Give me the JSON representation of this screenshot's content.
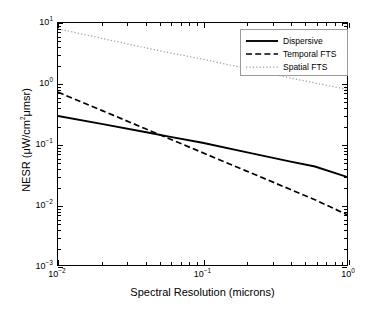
{
  "chart_data": {
    "type": "line",
    "title": "",
    "xlabel": "Spectral Resolution (microns)",
    "ylabel": "NESR (μW/cm²μmsr)",
    "xscale": "log",
    "yscale": "log",
    "xlim": [
      0.01,
      1.0
    ],
    "ylim": [
      0.001,
      10.0
    ],
    "grid": false,
    "legend_position": "top-right",
    "xticks": [
      0.01,
      0.1,
      1.0
    ],
    "xticklabels": [
      "10-2",
      "10-1",
      "100"
    ],
    "yticks": [
      0.001,
      0.01,
      0.1,
      1.0,
      10.0
    ],
    "yticklabels": [
      "10-3",
      "10-2",
      "10-1",
      "100",
      "101"
    ],
    "series": [
      {
        "name": "Dispersive",
        "style": "solid",
        "color": "#000000",
        "x": [
          0.01,
          0.02,
          0.04,
          0.06,
          0.1,
          0.2,
          0.4,
          0.6,
          1.0
        ],
        "y": [
          0.29,
          0.215,
          0.158,
          0.131,
          0.105,
          0.0735,
          0.0515,
          0.0425,
          0.0285
        ]
      },
      {
        "name": "Temporal FTS",
        "style": "dashed",
        "color": "#000000",
        "x": [
          0.01,
          0.02,
          0.04,
          0.06,
          0.1,
          0.2,
          0.4,
          0.6,
          1.0
        ],
        "y": [
          0.72,
          0.36,
          0.18,
          0.12,
          0.072,
          0.036,
          0.018,
          0.012,
          0.0068
        ]
      },
      {
        "name": "Spatial FTS",
        "style": "dotted",
        "color": "#9a9a9a",
        "x": [
          0.01,
          0.02,
          0.04,
          0.06,
          0.1,
          0.2,
          0.4,
          0.6,
          1.0
        ],
        "y": [
          8.0,
          5.6,
          3.9,
          3.2,
          2.53,
          1.77,
          1.24,
          1.02,
          0.8
        ]
      }
    ],
    "legend": [
      {
        "label": "Dispersive",
        "style": "solid"
      },
      {
        "label": "Temporal FTS",
        "style": "dashed"
      },
      {
        "label": "Spatial FTS",
        "style": "dotted"
      }
    ]
  }
}
